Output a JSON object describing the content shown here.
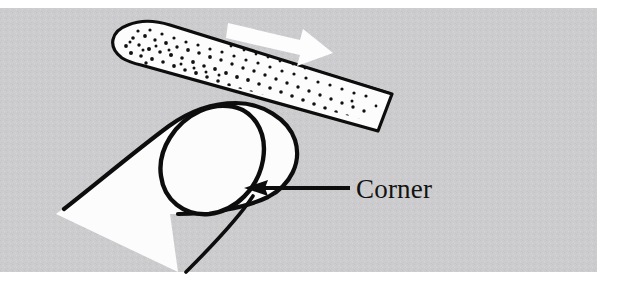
{
  "figure": {
    "kind": "line-art-illustration",
    "canvas": {
      "width": 635,
      "height": 292,
      "background": "#ffffff"
    },
    "panel": {
      "name": "illustration-panel",
      "fill": "#ccccce",
      "texture": "halftone-speckle",
      "x": 0,
      "y": 8,
      "width": 597,
      "height": 264
    },
    "annotations": [
      {
        "id": "corner-label",
        "text": "Corner",
        "color": "#121212",
        "font_size_px": 27,
        "x": 356,
        "y": 198,
        "leader": {
          "name": "corner-leader-arrow",
          "style": "solid-line-with-arrowhead",
          "color": "#0d0d0d",
          "direction": "left",
          "from_x": 350,
          "from_y": 188,
          "to_x": 244,
          "to_y": 188
        }
      }
    ],
    "motion_arrow": {
      "name": "filing-direction-arrow",
      "fill": "#fdfdfd",
      "direction": "right-down",
      "description": "white block arrow showing stroke direction along the emery board"
    },
    "objects": [
      {
        "name": "emery-board",
        "fill": "#fcfcfc",
        "outline": "#0d0d0d",
        "surface": "stippled-abrasive-grit",
        "description": "rounded-end nail file angled from upper-left down to right"
      },
      {
        "name": "finger",
        "fill": "#fcfcfc",
        "outline": "#0d0d0d",
        "description": "fingertip pointing up-right, overlapping the emery board"
      },
      {
        "name": "fingernail",
        "fill": "#fcfcfc",
        "outline": "#0d0d0d",
        "description": "oval nail plate on the fingertip; its corner is labelled"
      }
    ],
    "colors": {
      "panel_gray": "#ccccce",
      "ink_black": "#0d0d0d",
      "paper_white": "#fcfcfc",
      "page_white": "#ffffff"
    }
  }
}
